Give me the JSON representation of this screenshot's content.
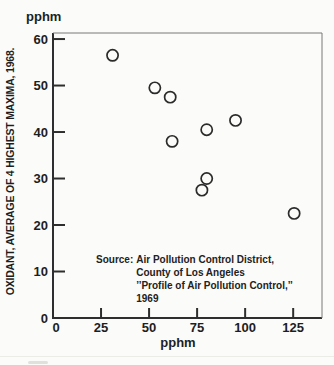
{
  "figure": {
    "background": "#fbfbf9",
    "ink": "#1e1e1e",
    "circle_stroke": "#2b2b2b"
  },
  "chart_data": {
    "type": "scatter",
    "title": "",
    "x_axis": {
      "unit": "pphm",
      "ticks": [
        0,
        25,
        50,
        75,
        100,
        125
      ],
      "range": [
        0,
        140
      ],
      "grid": false
    },
    "y_axis": {
      "unit": "pphm",
      "title": "OXIDANT, AVERAGE OF 4 HIGHEST MAXIMA, 1968.",
      "ticks": [
        0,
        10,
        20,
        30,
        40,
        50,
        60
      ],
      "range": [
        0,
        61.3
      ],
      "grid": false
    },
    "points": [
      {
        "x": 31,
        "y": 56.5
      },
      {
        "x": 53,
        "y": 49.5
      },
      {
        "x": 61,
        "y": 47.5
      },
      {
        "x": 62,
        "y": 38
      },
      {
        "x": 77.5,
        "y": 27.5
      },
      {
        "x": 80,
        "y": 40.5
      },
      {
        "x": 80,
        "y": 30
      },
      {
        "x": 95,
        "y": 42.5
      },
      {
        "x": 125.5,
        "y": 22.5
      }
    ],
    "legend": null,
    "source": {
      "label": "Source:",
      "lines": [
        "Air Pollution Control District,",
        "County of Los Angeles",
        "’’Profile of Air Pollution Control,’’",
        "1969"
      ]
    }
  }
}
